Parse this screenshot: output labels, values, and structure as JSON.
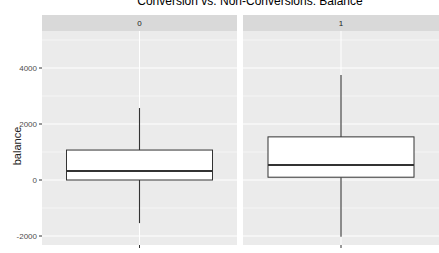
{
  "chart_data": {
    "type": "boxplot",
    "title": "Conversion vs. Non-Conversions: Balance",
    "xlabel": "",
    "ylabel": "balance",
    "facets": [
      "0",
      "1"
    ],
    "y_ticks": [
      -2000,
      0,
      2000,
      4000
    ],
    "ylim": [
      -2250,
      5800
    ],
    "grid": true,
    "series": [
      {
        "name": "0",
        "whisker_low": -1540,
        "q1": 0,
        "median": 320,
        "q3": 1070,
        "whisker_high": 2570
      },
      {
        "name": "1",
        "whisker_low": -2030,
        "q1": 100,
        "median": 540,
        "q3": 1540,
        "whisker_high": 3750
      }
    ]
  },
  "colors": {
    "panel_bg": "#ebebeb",
    "strip_bg": "#d9d9d9",
    "grid": "#ffffff",
    "box_fill": "#ffffff",
    "box_line": "#333333"
  }
}
